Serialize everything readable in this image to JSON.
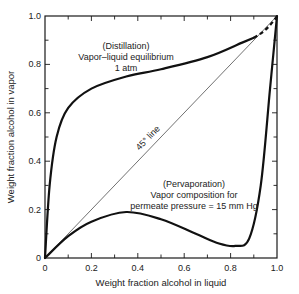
{
  "chart_data": {
    "type": "line",
    "title": "",
    "xlabel": "Weight fraction alcohol in liquid",
    "ylabel": "Weight fraction alcohol in vapor",
    "xlim": [
      0,
      1.0
    ],
    "ylim": [
      0,
      1.0
    ],
    "grid": false,
    "x_ticks": [
      "0",
      "0.2",
      "0.4",
      "0.6",
      "0.8",
      "1.0"
    ],
    "y_ticks": [
      "0",
      "0.2",
      "0.4",
      "0.6",
      "0.8",
      "1.0"
    ],
    "series": [
      {
        "name": "Distillation: Vapor-liquid equilibrium, 1 atm",
        "x": [
          0,
          0.02,
          0.05,
          0.1,
          0.2,
          0.35,
          0.5,
          0.7,
          0.85,
          0.9,
          1.0
        ],
        "y": [
          0,
          0.3,
          0.5,
          0.62,
          0.7,
          0.75,
          0.78,
          0.83,
          0.89,
          0.91,
          1.0
        ]
      },
      {
        "name": "Pervaporation: Vapor composition for permeate pressure = 15 mm Hg",
        "x": [
          0,
          0.1,
          0.2,
          0.35,
          0.5,
          0.65,
          0.75,
          0.82,
          0.88,
          0.93,
          0.97,
          1.0
        ],
        "y": [
          0,
          0.09,
          0.15,
          0.19,
          0.16,
          0.1,
          0.06,
          0.05,
          0.08,
          0.3,
          0.7,
          1.0
        ]
      },
      {
        "name": "45° line",
        "x": [
          0,
          1.0
        ],
        "y": [
          0,
          1.0
        ]
      }
    ],
    "annotations": {
      "distillation": [
        "(Distillation)",
        "Vapor–liquid equilibrium",
        "1 atm"
      ],
      "diagonal": "45° line",
      "pervaporation": [
        "(Pervaporation)",
        "Vapor composition for",
        "permeate pressure = 15 mm Hg"
      ]
    }
  }
}
